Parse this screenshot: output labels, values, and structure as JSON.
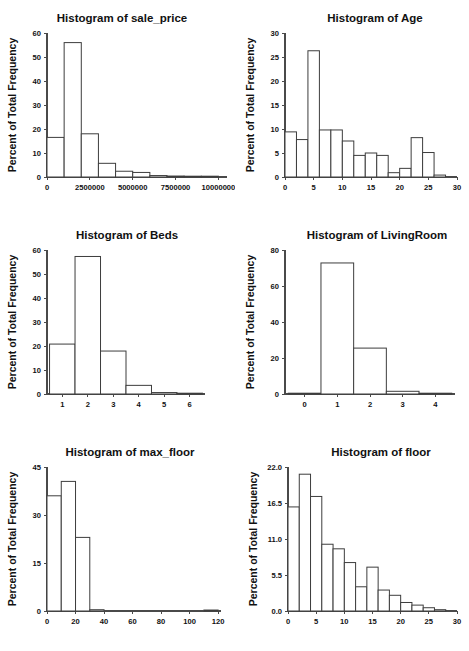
{
  "figure": {
    "title": "",
    "panel_count": 6,
    "layout": "2 columns x 3 rows",
    "shared_ylabel": "Percent of Total Frequency"
  },
  "chart_data": [
    {
      "type": "bar",
      "id": "sale_price",
      "title": "Histogram of sale_price",
      "xlabel": "",
      "ylabel": "Percent of Total Frequency",
      "grid": false,
      "legend": "none",
      "xlim": [
        0,
        10500000
      ],
      "ylim": [
        0,
        60
      ],
      "xticks": [
        0,
        2500000,
        5000000,
        7500000,
        10000000
      ],
      "xtick_labels": [
        "0",
        "2500000",
        "5000000",
        "7500000",
        "10000000"
      ],
      "yticks": [
        0,
        10,
        20,
        30,
        40,
        50,
        60
      ],
      "ytick_labels": [
        "0",
        "10",
        "20",
        "30",
        "40",
        "50",
        "60"
      ],
      "bin_width": 1000000,
      "bins": [
        {
          "start": 0,
          "end": 1000000,
          "value": 16.5
        },
        {
          "start": 1000000,
          "end": 2000000,
          "value": 56.0
        },
        {
          "start": 2000000,
          "end": 3000000,
          "value": 18.0
        },
        {
          "start": 3000000,
          "end": 4000000,
          "value": 5.7
        },
        {
          "start": 4000000,
          "end": 5000000,
          "value": 2.4
        },
        {
          "start": 5000000,
          "end": 6000000,
          "value": 1.9
        },
        {
          "start": 6000000,
          "end": 7000000,
          "value": 0.6
        },
        {
          "start": 7000000,
          "end": 8000000,
          "value": 0.4
        },
        {
          "start": 8000000,
          "end": 9000000,
          "value": 0.1
        },
        {
          "start": 9000000,
          "end": 10000000,
          "value": 0.1
        }
      ]
    },
    {
      "type": "bar",
      "id": "Age",
      "title": "Histogram of Age",
      "xlabel": "",
      "ylabel": "Percent of Total Frequency",
      "grid": false,
      "legend": "none",
      "xlim": [
        0,
        30
      ],
      "ylim": [
        0,
        30
      ],
      "xticks": [
        0,
        5,
        10,
        15,
        20,
        25,
        30
      ],
      "xtick_labels": [
        "0",
        "5",
        "10",
        "15",
        "20",
        "25",
        "30"
      ],
      "yticks": [
        0,
        5,
        10,
        15,
        20,
        25,
        30
      ],
      "ytick_labels": [
        "0",
        "5",
        "10",
        "15",
        "20",
        "25",
        "30"
      ],
      "bin_width": 2,
      "bins": [
        {
          "start": 0,
          "end": 2,
          "value": 9.4
        },
        {
          "start": 2,
          "end": 4,
          "value": 7.8
        },
        {
          "start": 4,
          "end": 6,
          "value": 26.3
        },
        {
          "start": 6,
          "end": 8,
          "value": 9.8
        },
        {
          "start": 8,
          "end": 10,
          "value": 9.8
        },
        {
          "start": 10,
          "end": 12,
          "value": 7.5
        },
        {
          "start": 12,
          "end": 14,
          "value": 4.5
        },
        {
          "start": 14,
          "end": 16,
          "value": 5.0
        },
        {
          "start": 16,
          "end": 18,
          "value": 4.5
        },
        {
          "start": 18,
          "end": 20,
          "value": 0.9
        },
        {
          "start": 20,
          "end": 22,
          "value": 1.8
        },
        {
          "start": 22,
          "end": 24,
          "value": 8.2
        },
        {
          "start": 24,
          "end": 26,
          "value": 5.1
        },
        {
          "start": 26,
          "end": 28,
          "value": 0.4
        }
      ]
    },
    {
      "type": "bar",
      "id": "Beds",
      "title": "Histogram of Beds",
      "xlabel": "",
      "ylabel": "Percent of Total Frequency",
      "grid": false,
      "legend": "none",
      "xlim": [
        0.4,
        6.6
      ],
      "ylim": [
        0,
        60
      ],
      "xticks": [
        1,
        2,
        3,
        4,
        5,
        6
      ],
      "xtick_labels": [
        "1",
        "2",
        "3",
        "4",
        "5",
        "6"
      ],
      "yticks": [
        0,
        10,
        20,
        30,
        40,
        50,
        60
      ],
      "ytick_labels": [
        "0",
        "10",
        "20",
        "30",
        "40",
        "50",
        "60"
      ],
      "bin_width": 1,
      "bins": [
        {
          "start": 0.5,
          "end": 1.5,
          "value": 20.8
        },
        {
          "start": 1.5,
          "end": 2.5,
          "value": 57.3
        },
        {
          "start": 2.5,
          "end": 3.5,
          "value": 17.9
        },
        {
          "start": 3.5,
          "end": 4.5,
          "value": 3.6
        },
        {
          "start": 4.5,
          "end": 5.5,
          "value": 0.6
        },
        {
          "start": 5.5,
          "end": 6.5,
          "value": 0.3
        }
      ]
    },
    {
      "type": "bar",
      "id": "LivingRoom",
      "title": "Histogram of LivingRoom",
      "xlabel": "",
      "ylabel": "Percent of Total Frequency",
      "grid": false,
      "legend": "none",
      "xlim": [
        -0.6,
        4.6
      ],
      "ylim": [
        0,
        80
      ],
      "xticks": [
        0,
        1,
        2,
        3,
        4
      ],
      "xtick_labels": [
        "0",
        "1",
        "2",
        "3",
        "4"
      ],
      "yticks": [
        0,
        20,
        40,
        60,
        80
      ],
      "ytick_labels": [
        "0",
        "20",
        "40",
        "60",
        "80"
      ],
      "bin_width": 1,
      "bins": [
        {
          "start": -0.5,
          "end": 0.5,
          "value": 0.4
        },
        {
          "start": 0.5,
          "end": 1.5,
          "value": 72.8
        },
        {
          "start": 1.5,
          "end": 2.5,
          "value": 25.5
        },
        {
          "start": 2.5,
          "end": 3.5,
          "value": 1.5
        },
        {
          "start": 3.5,
          "end": 4.5,
          "value": 0.2
        }
      ]
    },
    {
      "type": "bar",
      "id": "max_floor",
      "title": "Histogram of max_floor",
      "xlabel": "",
      "ylabel": "Percent of Total Frequency",
      "grid": false,
      "legend": "none",
      "xlim": [
        0,
        122
      ],
      "ylim": [
        0,
        45
      ],
      "xticks": [
        0,
        20,
        40,
        60,
        80,
        100,
        120
      ],
      "xtick_labels": [
        "0",
        "20",
        "40",
        "60",
        "80",
        "100",
        "120"
      ],
      "yticks": [
        0,
        15,
        30,
        45
      ],
      "ytick_labels": [
        "0",
        "15",
        "30",
        "45"
      ],
      "bin_width": 10,
      "bins": [
        {
          "start": 0,
          "end": 10,
          "value": 36.0
        },
        {
          "start": 10,
          "end": 20,
          "value": 40.5
        },
        {
          "start": 20,
          "end": 30,
          "value": 23.0
        },
        {
          "start": 30,
          "end": 40,
          "value": 0.4
        },
        {
          "start": 110,
          "end": 120,
          "value": 0.3
        }
      ]
    },
    {
      "type": "bar",
      "id": "floor",
      "title": "Histogram of floor",
      "xlabel": "",
      "ylabel": "Percent of Total Frequency",
      "grid": false,
      "legend": "none",
      "xlim": [
        0,
        30
      ],
      "ylim": [
        0,
        22
      ],
      "xticks": [
        0,
        5,
        10,
        15,
        20,
        25,
        30
      ],
      "xtick_labels": [
        "0",
        "5",
        "10",
        "15",
        "20",
        "25",
        "30"
      ],
      "yticks": [
        0,
        5.5,
        11,
        16.5,
        22
      ],
      "ytick_labels": [
        "0.0",
        "5.5",
        "11.0",
        "16.5",
        "22.0"
      ],
      "bin_width": 2,
      "bins": [
        {
          "start": 0,
          "end": 2,
          "value": 15.9
        },
        {
          "start": 2,
          "end": 4,
          "value": 20.9
        },
        {
          "start": 4,
          "end": 6,
          "value": 17.5
        },
        {
          "start": 6,
          "end": 8,
          "value": 10.2
        },
        {
          "start": 8,
          "end": 10,
          "value": 9.5
        },
        {
          "start": 10,
          "end": 12,
          "value": 7.4
        },
        {
          "start": 12,
          "end": 14,
          "value": 3.7
        },
        {
          "start": 14,
          "end": 16,
          "value": 6.7
        },
        {
          "start": 16,
          "end": 18,
          "value": 3.2
        },
        {
          "start": 18,
          "end": 20,
          "value": 2.4
        },
        {
          "start": 20,
          "end": 22,
          "value": 1.3
        },
        {
          "start": 22,
          "end": 24,
          "value": 0.9
        },
        {
          "start": 24,
          "end": 26,
          "value": 0.5
        },
        {
          "start": 26,
          "end": 28,
          "value": 0.2
        }
      ]
    }
  ]
}
